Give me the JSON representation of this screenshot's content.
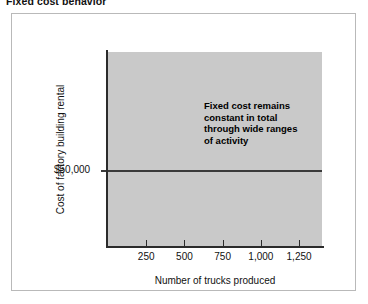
{
  "figure": {
    "title": "Fixed cost behavior",
    "frame_color": "#b9b9b9",
    "plot_fill_color": "#c9c9c9",
    "axis_color": "#2b2b2b",
    "line_color": "#3a3a3a"
  },
  "annotation": {
    "line1": "Fixed cost remains",
    "line2": "constant in total",
    "line3": "through wide ranges",
    "line4": "of activity",
    "full_text": "Fixed cost remains constant in total through wide ranges of activity"
  },
  "axes": {
    "y_title": "Cost of factory building rental",
    "y_value_label": "$50,000",
    "x_title": "Number of trucks produced",
    "x_tick_labels": [
      "250",
      "500",
      "750",
      "1,000",
      "1,250"
    ]
  },
  "chart_data": {
    "type": "line",
    "title": "Fixed cost behavior",
    "xlabel": "Number of trucks produced",
    "ylabel": "Cost of factory building rental",
    "xlim": [
      0,
      1400
    ],
    "ylim": [
      0,
      100000
    ],
    "grid": false,
    "legend": null,
    "x_ticks": [
      250,
      500,
      750,
      1000,
      1250
    ],
    "x_tick_labels": [
      "250",
      "500",
      "750",
      "1,000",
      "1,250"
    ],
    "y_ticks": [
      50000
    ],
    "y_tick_labels": [
      "$50,000"
    ],
    "series": [
      {
        "name": "Fixed cost (factory building rental)",
        "x": [
          0,
          250,
          500,
          750,
          1000,
          1250,
          1400
        ],
        "values": [
          50000,
          50000,
          50000,
          50000,
          50000,
          50000,
          50000
        ]
      }
    ],
    "annotations": [
      {
        "text": "Fixed cost remains constant in total through wide ranges of activity",
        "x": 900,
        "y": 75000
      }
    ]
  }
}
